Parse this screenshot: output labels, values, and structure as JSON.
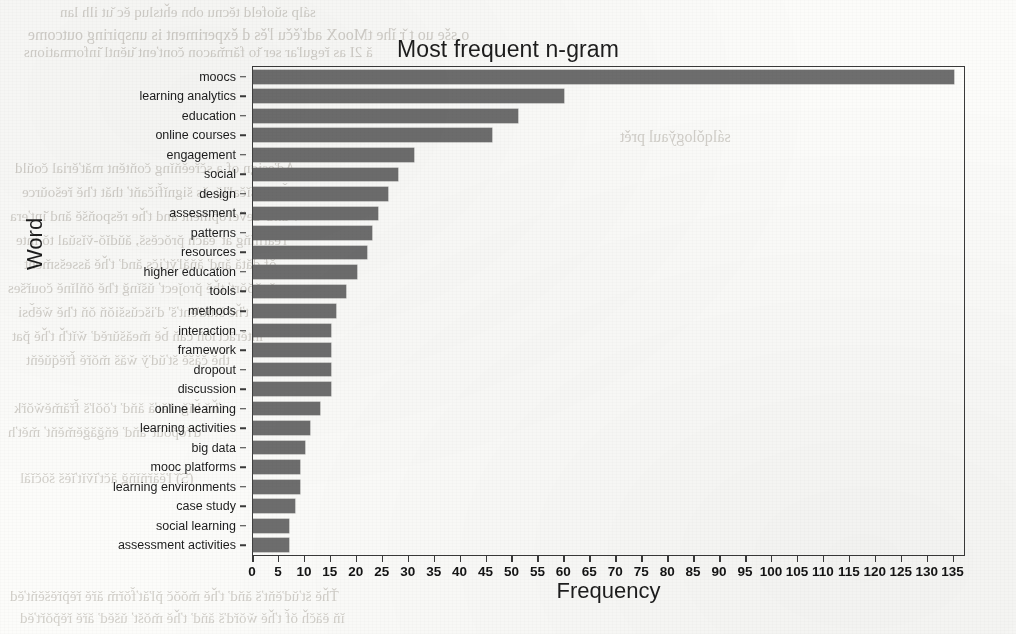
{
  "chart_data": {
    "type": "bar",
    "orientation": "horizontal",
    "title": "Most frequent n-gram",
    "xlabel": "Frequency",
    "ylabel": "Word",
    "xlim": [
      0,
      137
    ],
    "xticks": [
      0,
      5,
      10,
      15,
      20,
      25,
      30,
      35,
      40,
      45,
      50,
      55,
      60,
      65,
      70,
      75,
      80,
      85,
      90,
      95,
      100,
      105,
      110,
      115,
      120,
      125,
      130,
      135
    ],
    "grid": false,
    "legend": null,
    "bar_color": "#6e6e6e",
    "categories": [
      "moocs",
      "learning analytics",
      "education",
      "online courses",
      "engagement",
      "social",
      "design",
      "assessment",
      "patterns",
      "resources",
      "higher education",
      "tools",
      "methods",
      "interaction",
      "framework",
      "dropout",
      "discussion",
      "online learning",
      "learning activities",
      "big data",
      "mooc platforms",
      "learning environments",
      "case study",
      "social learning",
      "assessment activities"
    ],
    "values": [
      135,
      60,
      51,
      46,
      31,
      28,
      26,
      24,
      23,
      22,
      20,
      18,
      16,
      15,
      15,
      15,
      15,
      13,
      11,
      10,
      9,
      9,
      8,
      7,
      7
    ]
  }
}
